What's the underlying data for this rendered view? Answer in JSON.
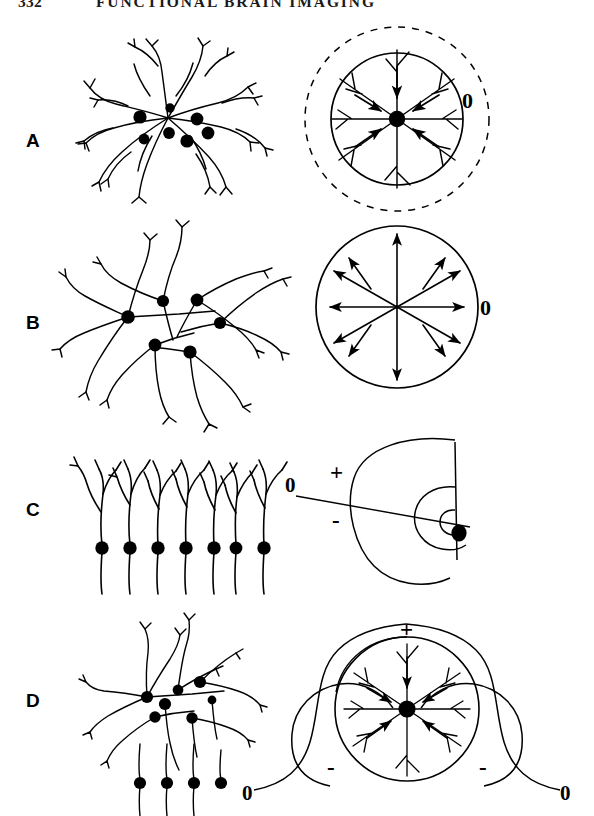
{
  "page": {
    "folio": "332",
    "running_head": "FUNCTIONAL BRAIN IMAGING",
    "background_color": "#ffffff",
    "ink_color": "#000000",
    "width": 594,
    "height": 816
  },
  "figure": {
    "caption": "",
    "panels": [
      {
        "id": "A",
        "letter": "A",
        "left_drawing": "closed-field neuron cluster with radially symmetric dendrites",
        "right_diagram": "closed field: solid circle with arrows converging inward to a central sink, enclosed by a dashed zero-potential circle",
        "labels": [
          {
            "text": "0",
            "x": 468,
            "y": 100,
            "size": 21
          }
        ]
      },
      {
        "id": "B",
        "letter": "B",
        "left_drawing": "neuron cluster with outward radiating dendrites",
        "right_diagram": "closed field: circle with eight arrows radiating outward from the center (source)",
        "labels": [
          {
            "text": "0",
            "x": 486,
            "y": 307,
            "size": 21
          }
        ]
      },
      {
        "id": "C",
        "letter": "C",
        "left_drawing": "palisade of seven parallel pyramidal neurons with apical dendrites",
        "right_diagram": "open dipole field: nested isopotential ovals around a vertical cell layer, zero line crossing the field",
        "labels": [
          {
            "text": "0",
            "x": 285,
            "y": 492,
            "size": 21
          },
          {
            "text": "+",
            "x": 330,
            "y": 480,
            "size": 22
          },
          {
            "text": "-",
            "x": 332,
            "y": 528,
            "size": 22
          }
        ]
      },
      {
        "id": "D",
        "letter": "D",
        "left_drawing": "mixed population: stellate cluster above a row of vertically oriented neurons",
        "right_diagram": "mixed open-closed field: central sink circle flanked by two negative lobes with zero lines extending outward",
        "labels": [
          {
            "text": "+",
            "x": 406,
            "y": 628,
            "size": 22
          },
          {
            "text": "-",
            "x": 331,
            "y": 768,
            "size": 22
          },
          {
            "text": "-",
            "x": 483,
            "y": 768,
            "size": 22
          },
          {
            "text": "0",
            "x": 248,
            "y": 793,
            "size": 21
          },
          {
            "text": "0",
            "x": 566,
            "y": 793,
            "size": 21
          }
        ]
      }
    ],
    "panel_letter_positions": [
      {
        "letter": "A",
        "x": 26,
        "y": 131
      },
      {
        "letter": "B",
        "x": 26,
        "y": 313
      },
      {
        "letter": "C",
        "x": 26,
        "y": 500
      },
      {
        "letter": "D",
        "x": 26,
        "y": 691
      }
    ]
  }
}
